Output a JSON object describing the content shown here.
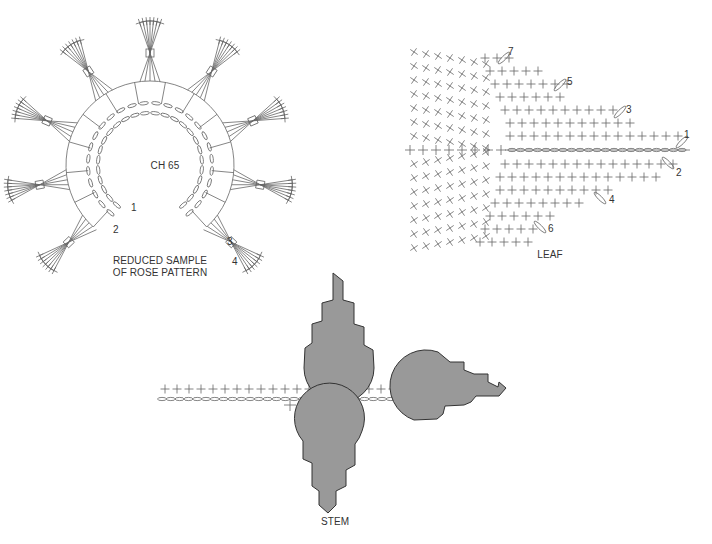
{
  "rose": {
    "center_label": "CH 65",
    "caption_line1": "REDUCED SAMPLE",
    "caption_line2": "OF ROSE PATTERN",
    "row_numbers": [
      "1",
      "2",
      "3",
      "4"
    ]
  },
  "leaf": {
    "caption": "LEAF",
    "row_numbers": [
      "1",
      "2",
      "3",
      "4",
      "5",
      "6",
      "7"
    ]
  },
  "stem": {
    "caption": "STEM"
  },
  "colors": {
    "line": "#666666",
    "shape_fill": "#999999",
    "shape_outline": "#333333",
    "background": "#ffffff"
  }
}
